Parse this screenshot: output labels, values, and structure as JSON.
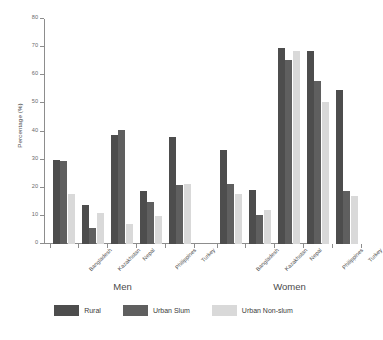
{
  "chart_data": {
    "type": "bar",
    "title": "",
    "xlabel": "",
    "ylabel": "Percentage (%)",
    "ylim": [
      0,
      80
    ],
    "yticks": [
      0,
      10,
      20,
      30,
      40,
      50,
      60,
      70,
      80
    ],
    "grid": false,
    "legend_position": "bottom",
    "categories": [
      "Bangladesh",
      "Kazakhstan",
      "Nepal",
      "Philippines",
      "Turkey"
    ],
    "groups": [
      "Men",
      "Women"
    ],
    "series": [
      {
        "name": "Rural",
        "color": "#4d4d4d"
      },
      {
        "name": "Urban Slum",
        "color": "#5f5f5f"
      },
      {
        "name": "Urban Non-slum",
        "color": "#d9d9d9"
      }
    ],
    "data": {
      "Men": {
        "Rural": [
          30.0,
          14.0,
          38.7,
          18.8,
          38.0
        ],
        "Urban Slum": [
          29.4,
          5.8,
          40.7,
          15.1,
          21.0
        ],
        "Urban Non-slum": [
          17.9,
          11.0,
          7.0,
          9.9,
          21.3
        ]
      },
      "Women": {
        "Rural": [
          33.5,
          19.1,
          69.8,
          68.7,
          54.9
        ],
        "Urban Slum": [
          21.3,
          10.3,
          65.3,
          57.8,
          18.8
        ],
        "Urban Non-slum": [
          17.8,
          12.2,
          68.7,
          50.5,
          17.0
        ]
      }
    }
  },
  "axis": {
    "y_title": "Percentage (%)",
    "y_labels": [
      "80",
      "70",
      "60",
      "50",
      "40",
      "30",
      "20",
      "10",
      "0"
    ]
  },
  "groups": [
    {
      "caption": "Men"
    },
    {
      "caption": "Women"
    }
  ],
  "countries": [
    {
      "label": "Bangladesh"
    },
    {
      "label": "Kazakhstan"
    },
    {
      "label": "Nepal"
    },
    {
      "label": "Philippines"
    },
    {
      "label": "Turkey"
    }
  ],
  "legend": {
    "items": [
      {
        "label": "Rural",
        "color": "#4d4d4d"
      },
      {
        "label": "Urban Slum",
        "color": "#5f5f5f"
      },
      {
        "label": "Urban Non-slum",
        "color": "#d9d9d9"
      }
    ]
  }
}
